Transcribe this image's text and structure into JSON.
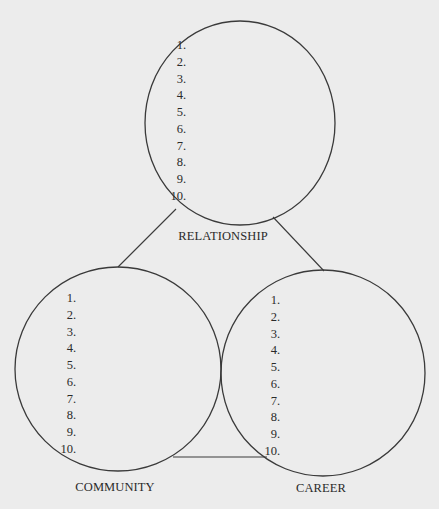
{
  "diagram": {
    "type": "three-circle worksheet",
    "background_color": "#ececec",
    "line_color": "#3a3a3a",
    "circles": [
      {
        "id": "relationship",
        "label": "RELATIONSHIP",
        "items": [
          "1.",
          "2.",
          "3.",
          "4.",
          "5.",
          "6.",
          "7.",
          "8.",
          "9.",
          "10."
        ]
      },
      {
        "id": "community",
        "label": "COMMUNITY",
        "items": [
          "1.",
          "2.",
          "3.",
          "4.",
          "5.",
          "6.",
          "7.",
          "8.",
          "9.",
          "10."
        ]
      },
      {
        "id": "career",
        "label": "CAREER",
        "items": [
          "1.",
          "2.",
          "3.",
          "4.",
          "5.",
          "6.",
          "7.",
          "8.",
          "9.",
          "10."
        ]
      }
    ],
    "connections": [
      {
        "from": "relationship",
        "to": "community"
      },
      {
        "from": "relationship",
        "to": "career"
      },
      {
        "from": "community",
        "to": "career"
      }
    ]
  }
}
